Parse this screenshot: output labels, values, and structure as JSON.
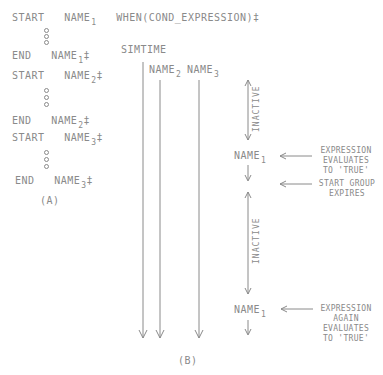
{
  "panel_a": {
    "line1": {
      "kw": "START",
      "name": "NAME",
      "sub": "1",
      "suffix": "WHEN(COND_EXPRESSION)‡"
    },
    "line2": {
      "kw": "END",
      "name": "NAME",
      "sub": "1",
      "suffix": "‡"
    },
    "line3": {
      "kw": "START",
      "name": "NAME",
      "sub": "2",
      "suffix": "‡"
    },
    "line4": {
      "kw": "END",
      "name": "NAME",
      "sub": "2",
      "suffix": "‡"
    },
    "line5": {
      "kw": "START",
      "name": "NAME",
      "sub": "3",
      "suffix": "‡"
    },
    "line6": {
      "kw": "END",
      "name": "NAME",
      "sub": "3",
      "suffix": "‡"
    },
    "caption": "(A)"
  },
  "panel_b": {
    "simtime": "SIMTIME",
    "name2": {
      "name": "NAME",
      "sub": "2"
    },
    "name3": {
      "name": "NAME",
      "sub": "3"
    },
    "inactive1": "INACTIVE",
    "inactive2": "INACTIVE",
    "event1": {
      "name": "NAME",
      "sub": "1"
    },
    "event2": {
      "name": "NAME",
      "sub": "1"
    },
    "note1": [
      "EXPRESSION",
      "EVALUATES",
      "TO 'TRUE'"
    ],
    "note2": [
      "START GROUP",
      "EXPIRES"
    ],
    "note3": [
      "EXPRESSION",
      "AGAIN",
      "EVALUATES",
      "TO 'TRUE'"
    ],
    "caption": "(B)"
  },
  "colors": {
    "ink": "#8a8a8a",
    "background": "#ffffff"
  }
}
